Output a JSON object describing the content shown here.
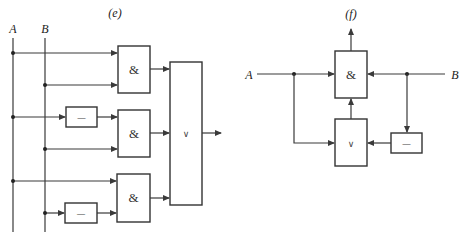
{
  "diagram_e": {
    "caption": "(e)",
    "inputs": {
      "a": "A",
      "b": "B"
    },
    "gates": {
      "and1": "&",
      "and2": "&",
      "and3": "&",
      "not1": "—",
      "not2": "—",
      "or": "∨"
    },
    "description": "Two-level AND-OR network: AB + A·B̄ (via NOT) + A·B̄ ... inputs A and B feed three AND gates (two via inverters), outputs combined in an OR gate"
  },
  "diagram_f": {
    "caption": "(f)",
    "inputs": {
      "a": "A",
      "b": "B"
    },
    "gates": {
      "and": "&",
      "or": "∨",
      "not": "—"
    },
    "description": "A and B feed an AND gate; A and NOT B feed an OR gate whose output feeds the AND gate; AND output goes up"
  },
  "colors": {
    "line": "#333333",
    "background": "#ffffff"
  }
}
